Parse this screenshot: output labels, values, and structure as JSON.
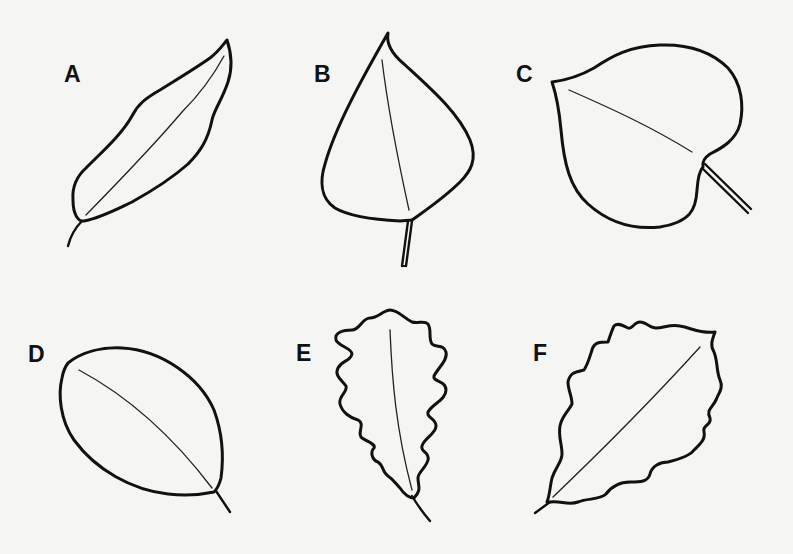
{
  "figure": {
    "background": "#f5f5f4",
    "stroke_color": "#111111",
    "leaves": [
      {
        "id": "A",
        "label": "A",
        "shape": "lanceolate / elongated, wavy margin, short curved stem"
      },
      {
        "id": "B",
        "label": "B",
        "shape": "deltoid / spade-like with pointed tip, straight stem"
      },
      {
        "id": "C",
        "label": "C",
        "shape": "cordate / heart-shaped, diagonal stem"
      },
      {
        "id": "D",
        "label": "D",
        "shape": "oval / elliptical, smooth margin, short stem"
      },
      {
        "id": "E",
        "label": "E",
        "shape": "lobed (oak-like), curved stem"
      },
      {
        "id": "F",
        "label": "F",
        "shape": "rhomboid with toothed/wavy margin, short stem"
      }
    ]
  }
}
